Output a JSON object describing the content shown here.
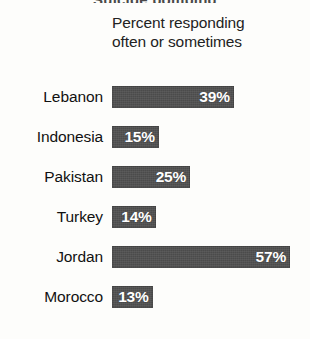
{
  "figure": {
    "clipped_title_fragment": "Suicide bombing",
    "heading_line1": "Percent responding",
    "heading_line2": "often or sometimes"
  },
  "chart_data": {
    "type": "bar",
    "orientation": "horizontal",
    "title": "",
    "subtitle": "Percent responding often or sometimes",
    "xlabel": "",
    "ylabel": "",
    "xlim": [
      0,
      60
    ],
    "grid": false,
    "legend": false,
    "value_suffix": "%",
    "bar_color": "#4b4b4b",
    "value_label_color": "#ffffff",
    "background_color": "#fdfdfb",
    "categories": [
      "Lebanon",
      "Indonesia",
      "Pakistan",
      "Turkey",
      "Jordan",
      "Morocco"
    ],
    "values": [
      39,
      15,
      25,
      14,
      57,
      13
    ],
    "value_labels": [
      "39%",
      "15%",
      "25%",
      "14%",
      "57%",
      "13%"
    ],
    "rows": [
      {
        "category": "Lebanon",
        "value": 39,
        "label": "39%"
      },
      {
        "category": "Indonesia",
        "value": 15,
        "label": "15%"
      },
      {
        "category": "Pakistan",
        "value": 25,
        "label": "25%"
      },
      {
        "category": "Turkey",
        "value": 14,
        "label": "14%"
      },
      {
        "category": "Jordan",
        "value": 57,
        "label": "57%"
      },
      {
        "category": "Morocco",
        "value": 13,
        "label": "13%"
      }
    ]
  }
}
